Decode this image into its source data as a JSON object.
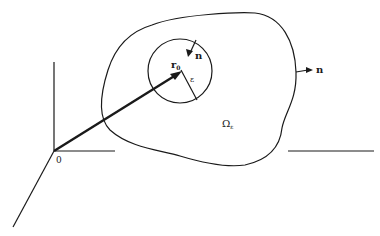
{
  "diagram": {
    "labels": {
      "origin": "0",
      "position_vector": "r",
      "position_subscript": "0",
      "inner_normal": "n",
      "outer_normal": "n",
      "radius": "ε",
      "region": "Ω",
      "region_subscript": "ε"
    },
    "colors": {
      "stroke": "#1a1a1a",
      "background": "#ffffff"
    }
  }
}
